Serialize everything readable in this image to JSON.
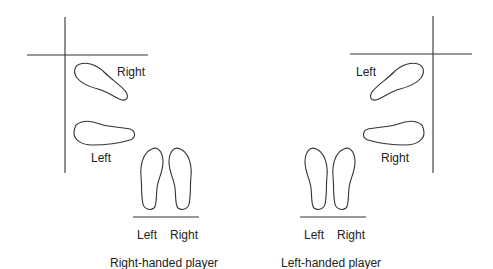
{
  "diagram": {
    "panels": [
      {
        "id": "right-handed",
        "caption": "Right-handed player",
        "labels": {
          "upper_foot": "Right",
          "lower_foot": "Left",
          "stance_left": "Left",
          "stance_right": "Right"
        }
      },
      {
        "id": "left-handed",
        "caption": "Left-handed player",
        "labels": {
          "upper_foot": "Left",
          "lower_foot": "Right",
          "stance_left": "Left",
          "stance_right": "Right"
        }
      }
    ],
    "colors": {
      "stroke": "#333333",
      "text": "#222222",
      "background": "#ffffff"
    }
  }
}
